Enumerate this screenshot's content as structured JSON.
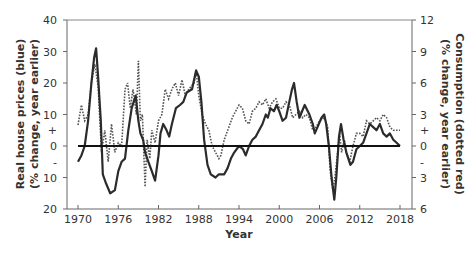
{
  "chart_data": {
    "type": "line",
    "title": "",
    "xlabel": "Year",
    "ylabel": "Real house prices (blue) (% change, year earlier)",
    "ylabel_line1": "Real house prices (blue)",
    "ylabel_line2": "(% change, year earlier)",
    "y2label": "Consumption (dotted red) (% change, year earlier)",
    "y2label_line1": "Consumption (dotted red)",
    "y2label_line2": "(% change, year earlier)",
    "xlim": [
      1970,
      2018
    ],
    "ylim": [
      -20,
      40
    ],
    "y2lim": [
      -6,
      12
    ],
    "grid": false,
    "legend": "none",
    "x_ticks": [
      "1970",
      "1976",
      "1982",
      "1988",
      "1994",
      "2000",
      "2006",
      "2012",
      "2018"
    ],
    "y_ticks_left": [
      {
        "value": 40,
        "label": "40"
      },
      {
        "value": 30,
        "label": "30"
      },
      {
        "value": 20,
        "label": "20"
      },
      {
        "value": 10,
        "label": "10"
      },
      {
        "value": 5,
        "label": "+",
        "minor": true
      },
      {
        "value": 0,
        "label": "0"
      },
      {
        "value": -5,
        "label": "-",
        "minor": true
      },
      {
        "value": -10,
        "label": "10"
      },
      {
        "value": -20,
        "label": "20"
      }
    ],
    "y_ticks_right": [
      {
        "value": 12,
        "label": "12"
      },
      {
        "value": 9,
        "label": "9"
      },
      {
        "value": 6,
        "label": "6"
      },
      {
        "value": 3,
        "label": "3"
      },
      {
        "value": 1.5,
        "label": "+",
        "minor": true
      },
      {
        "value": 0,
        "label": "0"
      },
      {
        "value": -1.5,
        "label": "-",
        "minor": true
      },
      {
        "value": -3,
        "label": "3"
      },
      {
        "value": -6,
        "label": "6"
      }
    ],
    "series": [
      {
        "name": "Real house prices",
        "axis": "left",
        "style": "solid",
        "color": "#2b2b2b",
        "x": [
          1970,
          1970.5,
          1971,
          1971.5,
          1972,
          1972.4,
          1972.7,
          1973,
          1973.4,
          1973.7,
          1974.2,
          1974.8,
          1975.5,
          1976,
          1976.5,
          1977,
          1977.5,
          1978,
          1978.6,
          1979,
          1979.3,
          1979.7,
          1980,
          1980.5,
          1981,
          1981.5,
          1982,
          1982.3,
          1982.7,
          1983.2,
          1983.6,
          1984,
          1984.6,
          1985.2,
          1985.7,
          1986.2,
          1987,
          1987.6,
          1988,
          1988.4,
          1988.8,
          1989.3,
          1989.8,
          1990.5,
          1991,
          1991.8,
          1992.3,
          1992.8,
          1993.3,
          1994,
          1994.6,
          1995,
          1995.5,
          1996,
          1996.5,
          1997,
          1997.5,
          1998,
          1998.3,
          1998.7,
          1999.2,
          1999.6,
          2000,
          2000.5,
          2001,
          2001.5,
          2001.9,
          2002.2,
          2002.6,
          2003,
          2003.4,
          2003.8,
          2004.5,
          2005,
          2005.3,
          2005.7,
          2006.3,
          2006.7,
          2007,
          2007.4,
          2007.8,
          2008.2,
          2008.5,
          2008.9,
          2009.2,
          2009.6,
          2010,
          2010.6,
          2011,
          2011.5,
          2012,
          2012.5,
          2013,
          2013.5,
          2014,
          2014.5,
          2015,
          2015.5,
          2016,
          2016.5,
          2017,
          2017.5,
          2018
        ],
        "values": [
          -5,
          -3,
          0,
          8,
          20,
          28,
          31,
          22,
          8,
          -9,
          -12,
          -15,
          -14,
          -8,
          -5,
          -4,
          5,
          12,
          16,
          8,
          4,
          2,
          -2,
          -5,
          -8,
          -11,
          -3,
          4,
          7,
          5,
          3,
          7,
          12,
          13,
          14,
          17,
          18,
          24,
          22,
          14,
          2,
          -6,
          -9,
          -10,
          -9,
          -9,
          -7,
          -4,
          -2,
          0,
          -1,
          -3,
          0,
          2,
          3,
          5,
          7,
          10,
          9,
          12,
          11,
          13,
          11,
          8,
          9,
          14,
          18,
          20,
          14,
          9,
          11,
          13,
          10,
          7,
          4,
          6,
          9,
          10,
          7,
          0,
          -10,
          -17,
          -10,
          3,
          7,
          2,
          -2,
          -6,
          -5,
          -1,
          0,
          1,
          4,
          7,
          6,
          5,
          7,
          4,
          3,
          4,
          2,
          1,
          0
        ]
      },
      {
        "name": "Consumption",
        "axis": "right",
        "style": "dotted",
        "color": "#555555",
        "x": [
          1970,
          1970.5,
          1971,
          1971.5,
          1972,
          1972.5,
          1973,
          1973.5,
          1974,
          1974.5,
          1975,
          1975.5,
          1976,
          1976.5,
          1977,
          1977.4,
          1977.8,
          1978.2,
          1978.7,
          1979,
          1979.3,
          1979.6,
          1980,
          1980.3,
          1980.7,
          1981,
          1981.5,
          1982,
          1982.5,
          1983,
          1983.5,
          1984,
          1984.5,
          1985,
          1985.5,
          1986,
          1986.5,
          1987.3,
          1987.6,
          1988,
          1988.5,
          1989,
          1989.5,
          1990,
          1990.5,
          1991,
          1991.3,
          1991.8,
          1992.5,
          1993,
          1993.5,
          1994,
          1994.5,
          1995,
          1995.5,
          1996,
          1996.5,
          1997,
          1997.5,
          1998,
          1998.5,
          1999,
          1999.5,
          2000,
          2000.5,
          2001,
          2001.5,
          2002,
          2002.5,
          2003,
          2003.5,
          2004,
          2004.5,
          2005,
          2005.5,
          2006,
          2006.7,
          2007.2,
          2007.6,
          2008,
          2008.3,
          2008.7,
          2009,
          2009.3,
          2009.7,
          2010,
          2010.5,
          2011,
          2011.5,
          2012,
          2012.5,
          2013,
          2013.5,
          2014,
          2014.5,
          2015,
          2015.5,
          2016,
          2016.5,
          2017,
          2017.5,
          2018
        ],
        "values": [
          2.0,
          3.9,
          2.4,
          3.0,
          6.0,
          7.8,
          5.7,
          -0.6,
          1.5,
          -1.5,
          2.1,
          -0.6,
          0.3,
          0.0,
          5.4,
          6.0,
          3.6,
          5.4,
          3.0,
          8.1,
          2.4,
          3.0,
          -3.9,
          0.6,
          -1.2,
          1.5,
          0.3,
          2.4,
          3.0,
          5.4,
          4.5,
          5.4,
          6.0,
          4.8,
          6.3,
          4.8,
          5.4,
          6.0,
          7.2,
          4.8,
          3.0,
          2.1,
          1.5,
          0.0,
          -0.6,
          -1.2,
          -0.9,
          0.6,
          1.8,
          2.7,
          3.3,
          3.9,
          3.6,
          2.4,
          2.1,
          3.3,
          3.6,
          4.2,
          3.9,
          4.5,
          3.6,
          4.2,
          4.5,
          3.6,
          3.6,
          4.2,
          3.9,
          2.7,
          3.0,
          3.3,
          2.7,
          3.0,
          2.7,
          1.5,
          1.8,
          2.4,
          2.7,
          1.8,
          -2.4,
          -4.2,
          -3.0,
          -0.6,
          1.2,
          -0.6,
          0.6,
          -0.6,
          -1.5,
          0.0,
          1.2,
          1.2,
          0.9,
          2.4,
          2.1,
          2.4,
          2.7,
          2.4,
          3.0,
          2.7,
          1.8,
          1.5,
          1.5,
          1.5
        ]
      }
    ],
    "reference_line": {
      "y": 0,
      "axis": "left",
      "style": "solid-bold",
      "x_from": 1970,
      "x_to": 2018
    }
  }
}
